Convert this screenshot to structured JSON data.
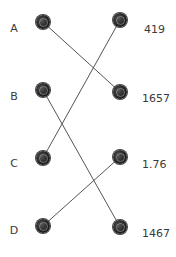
{
  "diagram": {
    "type": "matching",
    "left_items": [
      {
        "id": "A",
        "label": "A",
        "x": 43,
        "y": 22
      },
      {
        "id": "B",
        "label": "B",
        "x": 43,
        "y": 90
      },
      {
        "id": "C",
        "label": "C",
        "x": 43,
        "y": 158
      },
      {
        "id": "D",
        "label": "D",
        "x": 43,
        "y": 226
      }
    ],
    "right_items": [
      {
        "id": "r1",
        "label": "419",
        "x": 120,
        "y": 20
      },
      {
        "id": "r2",
        "label": "1657",
        "x": 120,
        "y": 92
      },
      {
        "id": "r3",
        "label": "1.76",
        "x": 120,
        "y": 157
      },
      {
        "id": "r4",
        "label": "1467",
        "x": 120,
        "y": 227
      }
    ],
    "connections": [
      {
        "from": "A",
        "to": "r2"
      },
      {
        "from": "B",
        "to": "r4"
      },
      {
        "from": "C",
        "to": "r1"
      },
      {
        "from": "D",
        "to": "r3"
      }
    ],
    "line_color": "#555555"
  }
}
